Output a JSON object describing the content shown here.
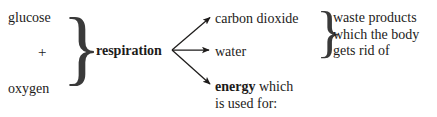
{
  "diagram": {
    "background_color": "#ffffff",
    "text_color": "#1d1b1a",
    "stroke_color": "#1d1b1a",
    "reactants": {
      "items": [
        "glucose",
        "oxygen"
      ],
      "operator": "+",
      "brace": "}"
    },
    "process": {
      "label": "respiration",
      "emphasis": "bold"
    },
    "products": {
      "items": [
        {
          "label": "carbon dioxide",
          "emphasis": "regular"
        },
        {
          "label": "water",
          "emphasis": "regular"
        }
      ],
      "brace": "}",
      "note_lines": [
        "waste products",
        "which the body",
        "gets rid of"
      ]
    },
    "energy": {
      "term": "energy",
      "term_emphasis": "bold",
      "suffix": " which",
      "second_line": "is used for:"
    },
    "arrows": [
      {
        "name": "arrow-to-carbon-dioxide",
        "x1": 172,
        "y1": 50,
        "x2": 211,
        "y2": 17
      },
      {
        "name": "arrow-to-water",
        "x1": 172,
        "y1": 50,
        "x2": 211,
        "y2": 50
      },
      {
        "name": "arrow-to-energy",
        "x1": 172,
        "y1": 50,
        "x2": 211,
        "y2": 85
      }
    ]
  }
}
